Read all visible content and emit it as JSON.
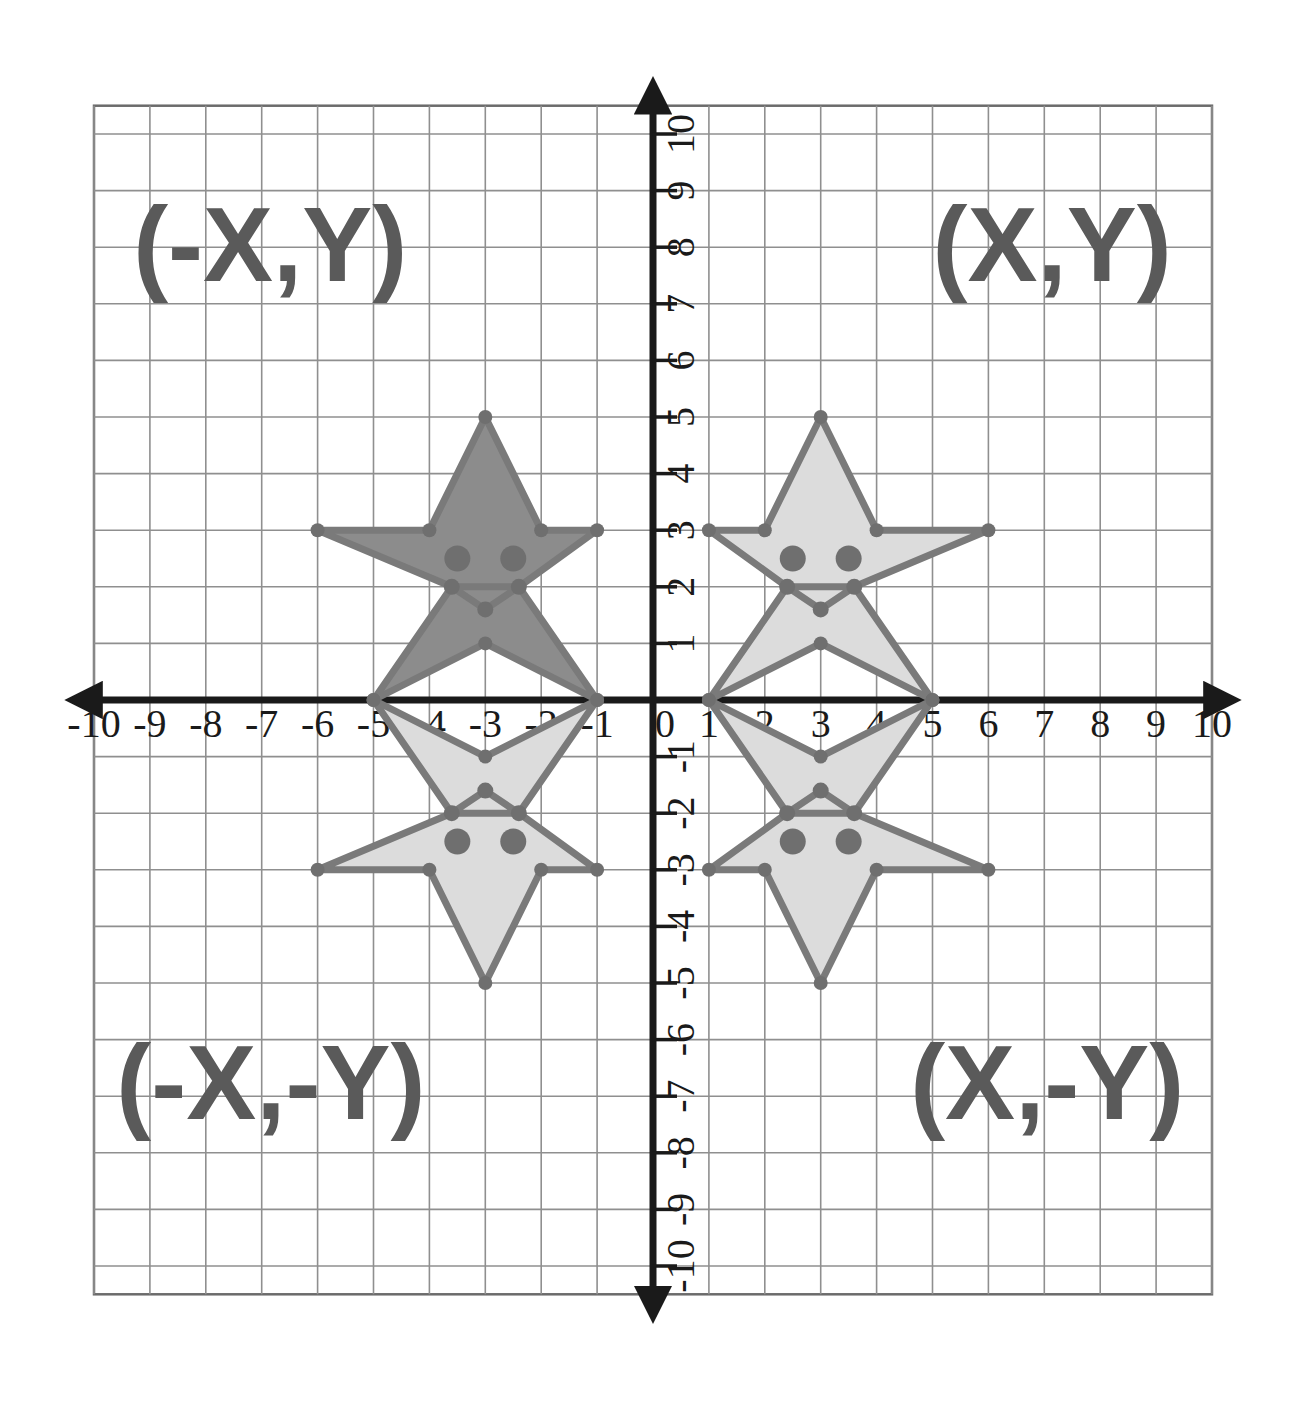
{
  "figure": {
    "type": "coordinate-plane"
  },
  "colors": {
    "background": "#ffffff",
    "grid_line": "#6b6b6b",
    "grid_line_minor": "#8f8f8f",
    "axis": "#1a1a1a",
    "star_stroke": "#7a7a7a",
    "star_fill_dark": "#8c8c8c",
    "star_fill_light": "#dcdcdc",
    "quadrant_label": "#5a5a5a",
    "tick_text": "#1a1a1a",
    "vertex_dot": "#6f6f6f"
  },
  "quadrant_labels": [
    {
      "name": "quadrant-2-label",
      "text": "(-X,Y)",
      "x": -9.3,
      "y": 7.4
    },
    {
      "name": "quadrant-1-label",
      "text": "(X,Y)",
      "x": 5.0,
      "y": 7.4
    },
    {
      "name": "quadrant-3-label",
      "text": "(-X,-Y)",
      "x": -9.6,
      "y": -7.4
    },
    {
      "name": "quadrant-4-label",
      "text": "(X,-Y)",
      "x": 4.6,
      "y": -7.4
    }
  ],
  "axes": {
    "x_label_values": [
      "-10",
      "-9",
      "-8",
      "-7",
      "-6",
      "-5",
      "-4",
      "-3",
      "-2",
      "-1",
      "0",
      "1",
      "2",
      "3",
      "4",
      "5",
      "6",
      "7",
      "8",
      "9",
      "10"
    ],
    "y_label_values": [
      "10",
      "9",
      "8",
      "7",
      "6",
      "5",
      "4",
      "3",
      "2",
      "1",
      "-1",
      "-2",
      "-3",
      "-4",
      "-5",
      "-6",
      "-7",
      "-8",
      "-9",
      "-10"
    ],
    "x_range": [
      -10,
      10
    ],
    "y_range": [
      -10,
      10
    ],
    "origin_label": "0",
    "x_arrows": "both",
    "y_arrows": "both"
  },
  "chart_data": {
    "type": "scatter",
    "xlabel": "",
    "ylabel": "",
    "xlim": [
      -10,
      10
    ],
    "ylim": [
      -10,
      10
    ],
    "grid": true,
    "legend": "none",
    "shapes": [
      {
        "name": "star-quadrant-1",
        "quadrant": "I",
        "sign": "(X,Y)",
        "fill": "#dcdcdc",
        "outline": [
          [
            3,
            5
          ],
          [
            2,
            3
          ],
          [
            1,
            3
          ],
          [
            2.4,
            2
          ],
          [
            1,
            0
          ],
          [
            3,
            1
          ],
          [
            5,
            0
          ],
          [
            3.6,
            2
          ],
          [
            6,
            3
          ],
          [
            4,
            3
          ]
        ],
        "eyes": [
          [
            2.5,
            2.5
          ],
          [
            3.5,
            2.5
          ]
        ],
        "mouth": [
          [
            2.4,
            2
          ],
          [
            3.6,
            2
          ],
          [
            3,
            1.6
          ]
        ]
      },
      {
        "name": "star-quadrant-2",
        "quadrant": "II",
        "sign": "(-X,Y)",
        "fill": "#8c8c8c",
        "outline": [
          [
            -3,
            5
          ],
          [
            -4,
            3
          ],
          [
            -6,
            3
          ],
          [
            -3.6,
            2
          ],
          [
            -5,
            0
          ],
          [
            -3,
            1
          ],
          [
            -1,
            0
          ],
          [
            -2.4,
            2
          ],
          [
            -1,
            3
          ],
          [
            -2,
            3
          ]
        ],
        "eyes": [
          [
            -3.5,
            2.5
          ],
          [
            -2.5,
            2.5
          ]
        ],
        "mouth": [
          [
            -3.6,
            2
          ],
          [
            -2.4,
            2
          ],
          [
            -3,
            1.6
          ]
        ]
      },
      {
        "name": "star-quadrant-3",
        "quadrant": "III",
        "sign": "(-X,-Y)",
        "fill": "#dcdcdc",
        "outline": [
          [
            -3,
            -5
          ],
          [
            -4,
            -3
          ],
          [
            -6,
            -3
          ],
          [
            -3.6,
            -2
          ],
          [
            -5,
            0
          ],
          [
            -3,
            -1
          ],
          [
            -1,
            0
          ],
          [
            -2.4,
            -2
          ],
          [
            -1,
            -3
          ],
          [
            -2,
            -3
          ]
        ],
        "eyes": [
          [
            -3.5,
            -2.5
          ],
          [
            -2.5,
            -2.5
          ]
        ],
        "mouth": [
          [
            -3.6,
            -2
          ],
          [
            -2.4,
            -2
          ],
          [
            -3,
            -1.6
          ]
        ]
      },
      {
        "name": "star-quadrant-4",
        "quadrant": "IV",
        "sign": "(X,-Y)",
        "fill": "#dcdcdc",
        "outline": [
          [
            3,
            -5
          ],
          [
            2,
            -3
          ],
          [
            1,
            -3
          ],
          [
            2.4,
            -2
          ],
          [
            1,
            0
          ],
          [
            3,
            -1
          ],
          [
            5,
            0
          ],
          [
            3.6,
            -2
          ],
          [
            6,
            -3
          ],
          [
            4,
            -3
          ]
        ],
        "eyes": [
          [
            2.5,
            -2.5
          ],
          [
            3.5,
            -2.5
          ]
        ],
        "mouth": [
          [
            2.4,
            -2
          ],
          [
            3.6,
            -2
          ],
          [
            3,
            -1.6
          ]
        ]
      }
    ]
  }
}
